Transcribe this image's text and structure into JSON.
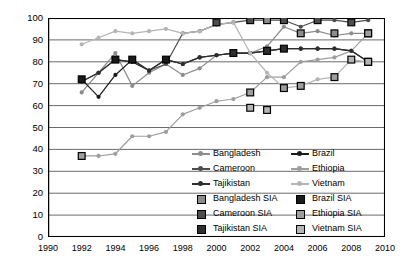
{
  "chart_data": {
    "type": "line",
    "title": "",
    "xlabel": "",
    "ylabel": "DPT3 Coverage (%)",
    "xlim": [
      1990,
      2010
    ],
    "ylim": [
      0,
      100
    ],
    "ytick_step": 10,
    "xtick_step": 2,
    "grid": "horizontal",
    "legend_position": "inside-lower-right",
    "yticks": [
      "0",
      "10",
      "20",
      "30",
      "40",
      "50",
      "60",
      "70",
      "80",
      "90",
      "100"
    ],
    "xticks": [
      "1990",
      "1992",
      "1994",
      "1996",
      "1998",
      "2000",
      "2002",
      "2004",
      "2006",
      "2008",
      "2010"
    ],
    "x": [
      1992,
      1993,
      1994,
      1995,
      1996,
      1997,
      1998,
      1999,
      2000,
      2001,
      2002,
      2003,
      2004,
      2005,
      2006,
      2007,
      2008,
      2009
    ],
    "series": [
      {
        "name": "Bangladesh",
        "color": "#8c8c8c",
        "marker": "circle",
        "values": [
          66,
          75,
          84,
          69,
          75,
          79,
          74,
          77,
          83,
          84,
          84,
          87,
          96,
          93,
          94,
          92,
          93,
          93
        ]
      },
      {
        "name": "Brazil",
        "color": "#1a1a1a",
        "marker": "circle",
        "values": [
          72,
          64,
          74,
          81,
          76,
          81,
          79,
          82,
          83,
          84,
          84,
          85,
          86,
          86,
          86,
          86,
          85,
          80
        ]
      },
      {
        "name": "Cameroon",
        "color": "#4d4d4d",
        "marker": "circle",
        "values": [
          71,
          75,
          81,
          80,
          76,
          79,
          93,
          94,
          97,
          98,
          99,
          99,
          99,
          96,
          99,
          99,
          98,
          99
        ]
      },
      {
        "name": "Ethiopia",
        "color": "#9e9e9e",
        "marker": "circle",
        "values": [
          37,
          37,
          38,
          46,
          46,
          48,
          56,
          59,
          62,
          63,
          66,
          73,
          73,
          80,
          81,
          82,
          85,
          93
        ]
      },
      {
        "name": "Tajikistan",
        "color": "#2e2e2e",
        "marker": "circle",
        "values": [
          71,
          75,
          81,
          80,
          76,
          81,
          79,
          82,
          83,
          84,
          84,
          85,
          86,
          86,
          86,
          86,
          85,
          80
        ]
      },
      {
        "name": "Vietnam",
        "color": "#b5b5b5",
        "marker": "circle",
        "values": [
          88,
          91,
          94,
          93,
          94,
          95,
          93,
          94,
          97,
          98,
          84,
          75,
          68,
          69,
          72,
          73,
          81,
          80
        ]
      }
    ],
    "sia_markers": [
      {
        "name": "Bangladesh SIA",
        "color": "#8c8c8c",
        "points": [
          [
            2003,
            99
          ],
          [
            2005,
            93
          ],
          [
            2007,
            93
          ],
          [
            2009,
            93
          ]
        ]
      },
      {
        "name": "Brazil SIA",
        "color": "#1a1a1a",
        "points": [
          [
            1992,
            72
          ],
          [
            1994,
            81
          ],
          [
            1995,
            81
          ],
          [
            1997,
            81
          ],
          [
            2003,
            85
          ],
          [
            2009,
            80
          ]
        ]
      },
      {
        "name": "Cameroon SIA",
        "color": "#4d4d4d",
        "points": [
          [
            2000,
            98
          ],
          [
            2002,
            99
          ],
          [
            2004,
            99
          ],
          [
            2006,
            99
          ],
          [
            2008,
            98
          ]
        ]
      },
      {
        "name": "Ethiopia SIA",
        "color": "#9e9e9e",
        "points": [
          [
            1992,
            37
          ],
          [
            2002,
            66
          ],
          [
            2004,
            68
          ],
          [
            2005,
            69
          ],
          [
            2007,
            73
          ],
          [
            2009,
            93
          ]
        ]
      },
      {
        "name": "Tajikistan SIA",
        "color": "#2e2e2e",
        "points": [
          [
            2001,
            84
          ],
          [
            2003,
            85
          ],
          [
            2004,
            86
          ]
        ]
      },
      {
        "name": "Vietnam SIA",
        "color": "#b5b5b5",
        "points": [
          [
            2002,
            59
          ],
          [
            2003,
            58
          ],
          [
            2008,
            81
          ],
          [
            2009,
            80
          ]
        ]
      }
    ],
    "legend": {
      "lines": [
        "Bangladesh",
        "Brazil",
        "Cameroon",
        "Ethiopia",
        "Tajikistan",
        "Vietnam"
      ],
      "squares": [
        "Bangladesh SIA",
        "Brazil SIA",
        "Cameroon SIA",
        "Ethiopia SIA",
        "Tajikistan SIA",
        "Vietnam SIA"
      ]
    }
  },
  "caption": ""
}
